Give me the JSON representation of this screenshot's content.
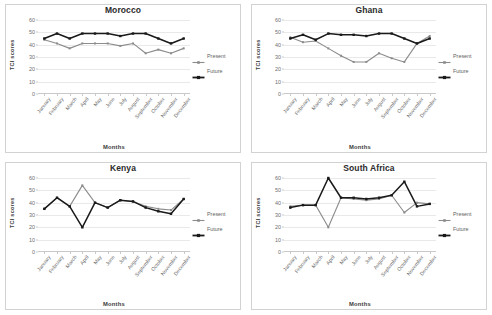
{
  "figure": {
    "panels": [
      "morocco",
      "ghana",
      "kenya",
      "south_africa"
    ]
  },
  "axes": {
    "ylabel": "TCI scores",
    "xlabel": "Months",
    "yticks": [
      "0",
      "10",
      "20",
      "30",
      "40",
      "50",
      "60"
    ],
    "ylim": [
      0,
      60
    ],
    "grid": true,
    "legend_position": "right"
  },
  "legend": {
    "present_label": "Present",
    "future_label": "Future"
  },
  "colors": {
    "present": "#8c8c8c",
    "future": "#1a1a1a",
    "grid": "#e9e9e9",
    "axis": "#c9c9c9",
    "title": "#2b2b2b",
    "tick_text": "#6e6e6e"
  },
  "chart_data": [
    {
      "type": "line",
      "title": "Morocco",
      "xlabel": "Months",
      "ylabel": "TCI scores",
      "ylim": [
        0,
        60
      ],
      "yticks": [
        0,
        10,
        20,
        30,
        40,
        50,
        60
      ],
      "grid": true,
      "legend": [
        "Present",
        "Future"
      ],
      "categories": [
        "January",
        "February",
        "March",
        "April",
        "May",
        "June",
        "July",
        "August",
        "September",
        "October",
        "November",
        "December"
      ],
      "series": [
        {
          "name": "Present",
          "values": [
            44,
            41,
            37,
            41,
            41,
            41,
            39,
            41,
            33,
            36,
            33,
            37
          ]
        },
        {
          "name": "Future",
          "values": [
            45,
            49,
            45,
            49,
            49,
            49,
            47,
            49,
            49,
            45,
            41,
            45
          ]
        }
      ]
    },
    {
      "type": "line",
      "title": "Ghana",
      "xlabel": "Months",
      "ylabel": "TCI scores",
      "ylim": [
        0,
        60
      ],
      "yticks": [
        0,
        10,
        20,
        30,
        40,
        50,
        60
      ],
      "grid": true,
      "legend": [
        "Present",
        "Future"
      ],
      "categories": [
        "January",
        "February",
        "March",
        "April",
        "May",
        "June",
        "July",
        "August",
        "September",
        "October",
        "November",
        "December"
      ],
      "series": [
        {
          "name": "Present",
          "values": [
            46,
            42,
            43,
            37,
            31,
            26,
            26,
            33,
            29,
            26,
            41,
            47
          ]
        },
        {
          "name": "Future",
          "values": [
            45,
            48,
            44,
            49,
            48,
            48,
            47,
            49,
            49,
            45,
            41,
            45
          ]
        }
      ]
    },
    {
      "type": "line",
      "title": "Kenya",
      "xlabel": "Months",
      "ylabel": "TCI scores",
      "ylim": [
        0,
        60
      ],
      "yticks": [
        0,
        10,
        20,
        30,
        40,
        50,
        60
      ],
      "grid": true,
      "legend": [
        "Present",
        "Future"
      ],
      "categories": [
        "January",
        "February",
        "March",
        "April",
        "May",
        "June",
        "July",
        "August",
        "September",
        "October",
        "November",
        "December"
      ],
      "series": [
        {
          "name": "Present",
          "values": [
            35,
            44,
            37,
            54,
            40,
            36,
            42,
            41,
            37,
            35,
            34,
            43
          ]
        },
        {
          "name": "Future",
          "values": [
            35,
            44,
            37,
            20,
            40,
            36,
            42,
            41,
            36,
            33,
            31,
            43
          ]
        }
      ]
    },
    {
      "type": "line",
      "title": "South Africa",
      "xlabel": "Months",
      "ylabel": "TCI scores",
      "ylim": [
        0,
        60
      ],
      "yticks": [
        0,
        10,
        20,
        30,
        40,
        50,
        60
      ],
      "grid": true,
      "legend": [
        "Present",
        "Future"
      ],
      "categories": [
        "January",
        "February",
        "March",
        "April",
        "May",
        "June",
        "July",
        "August",
        "September",
        "October",
        "November",
        "December"
      ],
      "series": [
        {
          "name": "Present",
          "values": [
            37,
            38,
            38,
            20,
            44,
            43,
            42,
            43,
            46,
            32,
            40,
            39
          ]
        },
        {
          "name": "Future",
          "values": [
            36,
            38,
            38,
            60,
            44,
            44,
            43,
            44,
            46,
            57,
            37,
            39
          ]
        }
      ]
    }
  ]
}
